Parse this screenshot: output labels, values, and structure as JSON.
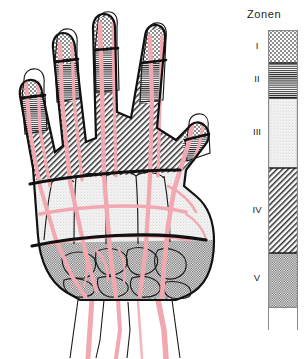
{
  "legend": {
    "title": "Zonen",
    "bar": {
      "x": 268,
      "width": 30,
      "top": 30,
      "bottom": 308
    },
    "tail": {
      "top": 308,
      "bottom": 330
    },
    "zones": [
      {
        "numeral": "I",
        "name": "zone-1",
        "top": 30,
        "bottom": 63,
        "pattern": "coarse-checker",
        "label_y": 40,
        "fill": "#b5b5b5"
      },
      {
        "numeral": "II",
        "name": "zone-2",
        "top": 63,
        "bottom": 98,
        "pattern": "horizontal-lines",
        "label_y": 73,
        "fill": "#9a9a9a"
      },
      {
        "numeral": "III",
        "name": "zone-3",
        "top": 98,
        "bottom": 168,
        "pattern": "light-stipple",
        "label_y": 126,
        "fill": "#efefef"
      },
      {
        "numeral": "IV",
        "name": "zone-4",
        "top": 168,
        "bottom": 253,
        "pattern": "diagonal-hatch",
        "label_y": 204,
        "fill": "#bdbdbd"
      },
      {
        "numeral": "V",
        "name": "zone-5",
        "top": 253,
        "bottom": 308,
        "pattern": "fine-checker",
        "label_y": 272,
        "fill": "#cfcfcf"
      }
    ]
  },
  "figure": {
    "caption": "",
    "view": "palmar",
    "digits": [
      {
        "name": "thumb",
        "zones": [
          "I",
          "II",
          "IV"
        ]
      },
      {
        "name": "index",
        "zones": [
          "I",
          "II",
          "IV"
        ]
      },
      {
        "name": "middle",
        "zones": [
          "I",
          "II",
          "IV"
        ]
      },
      {
        "name": "ring",
        "zones": [
          "I",
          "II",
          "IV"
        ]
      },
      {
        "name": "little",
        "zones": [
          "I",
          "II",
          "IV"
        ]
      }
    ],
    "palm_zones": [
      "III",
      "V"
    ],
    "colors": {
      "outline": "#1a1a1a",
      "tendon_pink": "#f2a8b0",
      "tendon_pink_dark": "#e58e99",
      "bone_fill": "#e8e8e8",
      "background": "#ffffff"
    }
  }
}
